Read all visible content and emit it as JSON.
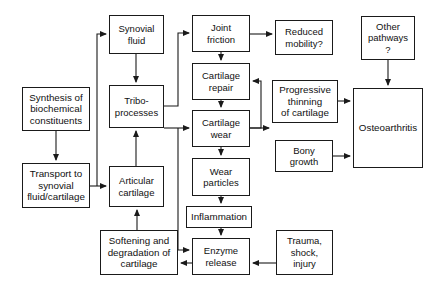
{
  "diagram": {
    "background_color": "#ffffff",
    "line_color": "#1a1a1a",
    "text_color": "#111111",
    "nodes": [
      {
        "id": "synthesis",
        "label": "Synthesis of\nbiochemical\nconstituents",
        "x": 22,
        "y": 87,
        "w": 68,
        "h": 44
      },
      {
        "id": "transport",
        "label": "Transport to\nsynovial\nfluid/cartilage",
        "x": 22,
        "y": 163,
        "w": 68,
        "h": 45
      },
      {
        "id": "synovial",
        "label": "Synovial\nfluid",
        "x": 109,
        "y": 15,
        "w": 55,
        "h": 39
      },
      {
        "id": "tribo",
        "label": "Tribo-\nprocesses",
        "x": 109,
        "y": 85,
        "w": 55,
        "h": 43
      },
      {
        "id": "articular",
        "label": "Articular\ncartilage",
        "x": 109,
        "y": 166,
        "w": 55,
        "h": 41
      },
      {
        "id": "softening",
        "label": "Softening and\ndegradation of\ncartilage",
        "x": 100,
        "y": 230,
        "w": 78,
        "h": 45
      },
      {
        "id": "joint",
        "label": "Joint\nfriction",
        "x": 192,
        "y": 15,
        "w": 58,
        "h": 37
      },
      {
        "id": "repair",
        "label": "Cartilage\nrepair",
        "x": 192,
        "y": 63,
        "w": 58,
        "h": 37
      },
      {
        "id": "wear",
        "label": "Cartilage\nwear",
        "x": 192,
        "y": 110,
        "w": 58,
        "h": 37
      },
      {
        "id": "particles",
        "label": "Wear\nparticles",
        "x": 192,
        "y": 158,
        "w": 58,
        "h": 38
      },
      {
        "id": "inflammation",
        "label": "Inflammation",
        "x": 186,
        "y": 206,
        "w": 66,
        "h": 22
      },
      {
        "id": "enzyme",
        "label": "Enzyme\nrelease",
        "x": 192,
        "y": 238,
        "w": 58,
        "h": 37
      },
      {
        "id": "reduced",
        "label": "Reduced\nmobility?",
        "x": 275,
        "y": 20,
        "w": 58,
        "h": 35
      },
      {
        "id": "progressive",
        "label": "Progressive\nthinning\nof cartilage",
        "x": 272,
        "y": 80,
        "w": 66,
        "h": 43
      },
      {
        "id": "bony",
        "label": "Bony\ngrowth",
        "x": 275,
        "y": 140,
        "w": 58,
        "h": 32
      },
      {
        "id": "trauma",
        "label": "Trauma,\nshock,\ninjury",
        "x": 276,
        "y": 230,
        "w": 57,
        "h": 45
      },
      {
        "id": "other",
        "label": "Other\npathways\n?",
        "x": 361,
        "y": 16,
        "w": 54,
        "h": 44
      },
      {
        "id": "osteo",
        "label": "Osteoarthritis",
        "x": 353,
        "y": 88,
        "w": 70,
        "h": 80
      }
    ],
    "edges": [
      {
        "from": "synthesis",
        "to": "transport",
        "path": "M56,131 L56,160",
        "arrow": "down"
      },
      {
        "from": "transport",
        "to": "articular",
        "path": "M90,186 L106,186",
        "arrow": "right"
      },
      {
        "from": "transport",
        "to": "synovial",
        "path": "M97,186 L97,34 L106,34",
        "arrow": "right"
      },
      {
        "from": "synovial",
        "to": "tribo",
        "path": "M136,54 L136,82",
        "arrow": "down"
      },
      {
        "from": "articular",
        "to": "tribo",
        "path": "M136,166 L136,131",
        "arrow": "up"
      },
      {
        "from": "softening",
        "to": "articular",
        "path": "M137,230 L137,210",
        "arrow": "up"
      },
      {
        "from": "tribo",
        "to": "joint",
        "path": "M164,106 L178,106 L178,33 L189,33",
        "arrow": "right"
      },
      {
        "from": "tribo",
        "to": "wear",
        "path": "M164,128 L189,128",
        "arrow": "right"
      },
      {
        "from": "joint",
        "to": "reduced",
        "path": "M250,34 L272,34",
        "arrow": "right"
      },
      {
        "from": "joint",
        "to": "repair",
        "path": "M221,52 L221,60",
        "arrow": "down"
      },
      {
        "from": "repair",
        "to": "wear",
        "path": "M221,100 L221,107",
        "arrow": "down"
      },
      {
        "from": "wear",
        "to": "repair",
        "path": "M250,128 L261,128 L261,81 L253,81",
        "arrow": "left"
      },
      {
        "from": "wear",
        "to": "progressive",
        "path": "M250,128 L269,128",
        "arrow": "right"
      },
      {
        "from": "wear",
        "to": "particles",
        "path": "M221,147 L221,155",
        "arrow": "down"
      },
      {
        "from": "particles",
        "to": "inflammation",
        "path": "M221,196 L221,203",
        "arrow": "down"
      },
      {
        "from": "inflammation",
        "to": "enzyme",
        "path": "M221,228 L221,235",
        "arrow": "down"
      },
      {
        "from": "wear_branch",
        "to": "enzyme",
        "path": "M178,128 L178,250 L189,250",
        "arrow": "right"
      },
      {
        "from": "enzyme",
        "to": "softening",
        "path": "M192,263 L181,263",
        "arrow": "left"
      },
      {
        "from": "trauma",
        "to": "enzyme",
        "path": "M276,263 L253,263",
        "arrow": "left"
      },
      {
        "from": "progressive",
        "to": "osteo",
        "path": "M338,101 L350,101",
        "arrow": "right"
      },
      {
        "from": "bony",
        "to": "osteo",
        "path": "M333,156 L350,156",
        "arrow": "right"
      },
      {
        "from": "other",
        "to": "osteo",
        "path": "M388,60 L388,85",
        "arrow": "down"
      }
    ]
  }
}
